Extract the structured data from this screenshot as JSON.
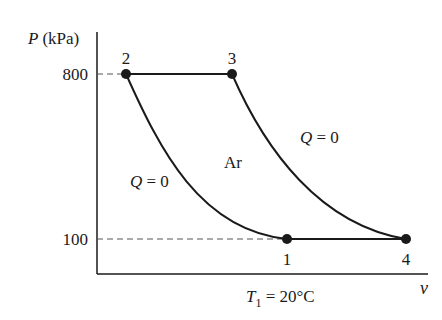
{
  "diagram": {
    "type": "P-v diagram",
    "substance_label": "Ar",
    "y_axis": {
      "symbol": "P",
      "unit": "(kPa)",
      "ticks": [
        {
          "label": "800",
          "y": 74
        },
        {
          "label": "100",
          "y": 239
        }
      ]
    },
    "x_axis": {
      "symbol": "v"
    },
    "condition": {
      "symbol": "T",
      "subscript": "1",
      "rest": " = 20°C"
    },
    "points": [
      {
        "label": "1",
        "x": 287,
        "y": 239
      },
      {
        "label": "2",
        "x": 126,
        "y": 74
      },
      {
        "label": "3",
        "x": 232,
        "y": 74
      },
      {
        "label": "4",
        "x": 406,
        "y": 239
      }
    ],
    "process_labels": [
      {
        "sym": "Q",
        "rest": " = 0",
        "where": "left curve 1-2"
      },
      {
        "sym": "Q",
        "rest": " = 0",
        "where": "right curve 3-4"
      }
    ],
    "colors": {
      "line": "#1a1a1a",
      "dash": "#555555",
      "background": "#ffffff"
    }
  }
}
